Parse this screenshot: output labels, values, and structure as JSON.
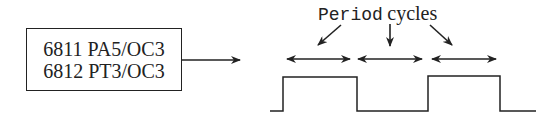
{
  "diagram": {
    "source_box": {
      "lines": [
        "6811 PA5/OC3",
        "6812 PT3/OC3"
      ]
    },
    "label": {
      "code_part": "Period",
      "text_part": "cycles"
    },
    "waveform": {
      "type": "square-wave",
      "color": "#222222",
      "points": [
        [
          270,
          111
        ],
        [
          283,
          111
        ],
        [
          283,
          77
        ],
        [
          357,
          77
        ],
        [
          357,
          111
        ],
        [
          428,
          111
        ],
        [
          428,
          76
        ],
        [
          500,
          76
        ],
        [
          500,
          111
        ],
        [
          536,
          111
        ]
      ]
    },
    "period_arrows": [
      {
        "x1": 287,
        "x2": 350,
        "y": 59
      },
      {
        "x1": 358,
        "x2": 422,
        "y": 59
      },
      {
        "x1": 432,
        "x2": 496,
        "y": 59
      }
    ]
  }
}
